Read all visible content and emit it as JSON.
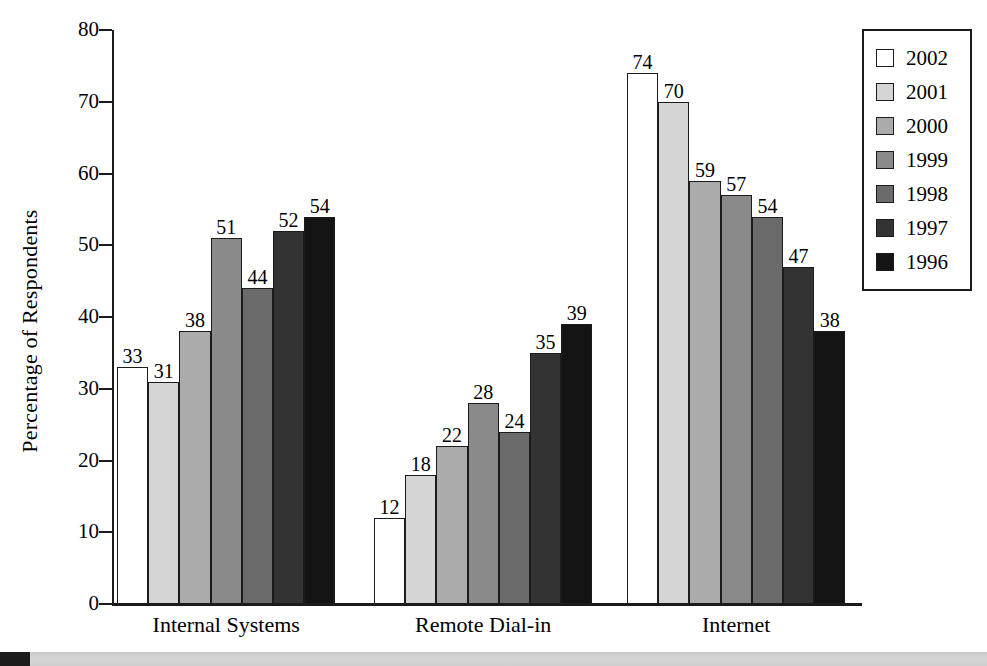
{
  "chart_data": {
    "type": "bar",
    "title": "",
    "xlabel": "",
    "ylabel": "Percentage of Respondents",
    "ylim": [
      0,
      80
    ],
    "ytick_labels": [
      "0",
      "10",
      "20",
      "30",
      "40",
      "50",
      "60",
      "70",
      "80"
    ],
    "ytick_values": [
      0,
      10,
      20,
      30,
      40,
      50,
      60,
      70,
      80
    ],
    "grid": false,
    "legend_position": "top-right",
    "categories": [
      "Internal Systems",
      "Remote Dial-in",
      "Internet"
    ],
    "series": [
      {
        "name": "2002",
        "color": "#ffffff",
        "values": [
          33,
          12,
          74
        ]
      },
      {
        "name": "2001",
        "color": "#d5d5d5",
        "values": [
          31,
          18,
          70
        ]
      },
      {
        "name": "2000",
        "color": "#ababab",
        "values": [
          38,
          22,
          59
        ]
      },
      {
        "name": "1999",
        "color": "#8a8a8a",
        "values": [
          51,
          28,
          57
        ]
      },
      {
        "name": "1998",
        "color": "#6b6b6b",
        "values": [
          44,
          24,
          54
        ]
      },
      {
        "name": "1997",
        "color": "#333333",
        "values": [
          52,
          35,
          47
        ]
      },
      {
        "name": "1996",
        "color": "#141414",
        "values": [
          54,
          39,
          38
        ]
      }
    ]
  },
  "legend": {
    "entries": [
      {
        "label": "2002",
        "color": "#ffffff"
      },
      {
        "label": "2001",
        "color": "#d5d5d5"
      },
      {
        "label": "2000",
        "color": "#ababab"
      },
      {
        "label": "1999",
        "color": "#8a8a8a"
      },
      {
        "label": "1998",
        "color": "#6b6b6b"
      },
      {
        "label": "1997",
        "color": "#333333"
      },
      {
        "label": "1996",
        "color": "#141414"
      }
    ]
  },
  "colors": {
    "axis": "#1b1b1b",
    "text": "#000000",
    "background": "#ffffff",
    "bottom_band": "#d2d2d2",
    "bottom_band_mark": "#1c1c1c"
  }
}
